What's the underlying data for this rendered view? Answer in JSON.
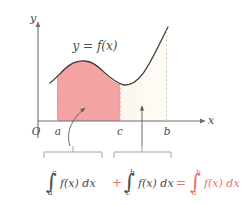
{
  "figure": {
    "title_label": "y = f(x)",
    "axes": {
      "y_label": "y",
      "x_label": "x",
      "origin_label": "O"
    },
    "ticks": [
      {
        "name": "a",
        "label": "a"
      },
      {
        "name": "c",
        "label": "c"
      },
      {
        "name": "b",
        "label": "b"
      }
    ],
    "regions": [
      {
        "name": "region-a-to-c",
        "fill": "#f4a3a3",
        "from": "a",
        "to": "c"
      },
      {
        "name": "region-c-to-b",
        "fill": "#fdf8ef",
        "from": "c",
        "to": "b"
      }
    ],
    "colors": {
      "pink_fill": "#f4a3a3",
      "cream_fill": "#fdf8ef",
      "curve_stroke": "#3d3d3d",
      "axis_stroke": "#6e6e6e",
      "red_accent": "#e8736e",
      "bracket_stroke": "#9a9a9a"
    },
    "formula": {
      "term1": {
        "integral_sign": "∫",
        "lower": "a",
        "upper": "c",
        "body": "f(x) dx"
      },
      "plus": "+",
      "term2": {
        "integral_sign": "∫",
        "lower": "c",
        "upper": "b",
        "body": "f(x) dx"
      },
      "equals": "=",
      "term3": {
        "integral_sign": "∫",
        "lower": "a",
        "upper": "b",
        "body": "f(x) dx"
      }
    }
  }
}
